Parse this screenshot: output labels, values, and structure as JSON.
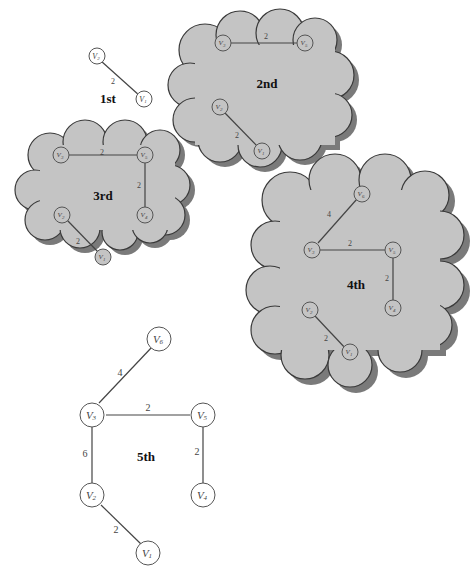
{
  "diagram": {
    "stages": [
      {
        "label": "1st",
        "nodes": [
          {
            "id": "V2",
            "name": "V",
            "sub": "2"
          },
          {
            "id": "V1",
            "name": "V",
            "sub": "1"
          }
        ],
        "edges": [
          {
            "from": "V2",
            "to": "V1",
            "weight": "2"
          }
        ]
      },
      {
        "label": "2nd",
        "nodes": [
          {
            "id": "V3",
            "name": "V",
            "sub": "3"
          },
          {
            "id": "V5",
            "name": "V",
            "sub": "5"
          },
          {
            "id": "V2",
            "name": "V",
            "sub": "2"
          },
          {
            "id": "V1",
            "name": "V",
            "sub": "1"
          }
        ],
        "edges": [
          {
            "from": "V3",
            "to": "V5",
            "weight": "2"
          },
          {
            "from": "V2",
            "to": "V1",
            "weight": "2"
          }
        ]
      },
      {
        "label": "3rd",
        "nodes": [
          {
            "id": "V3",
            "name": "V",
            "sub": "3"
          },
          {
            "id": "V5",
            "name": "V",
            "sub": "5"
          },
          {
            "id": "V2",
            "name": "V",
            "sub": "2"
          },
          {
            "id": "V4",
            "name": "V",
            "sub": "4"
          },
          {
            "id": "V1",
            "name": "V",
            "sub": "1"
          }
        ],
        "edges": [
          {
            "from": "V3",
            "to": "V5",
            "weight": "2"
          },
          {
            "from": "V5",
            "to": "V4",
            "weight": "2"
          },
          {
            "from": "V2",
            "to": "V1",
            "weight": "2"
          }
        ]
      },
      {
        "label": "4th",
        "nodes": [
          {
            "id": "V6",
            "name": "V",
            "sub": "6"
          },
          {
            "id": "V3",
            "name": "V",
            "sub": "3"
          },
          {
            "id": "V5",
            "name": "V",
            "sub": "5"
          },
          {
            "id": "V2",
            "name": "V",
            "sub": "2"
          },
          {
            "id": "V4",
            "name": "V",
            "sub": "4"
          },
          {
            "id": "V1",
            "name": "V",
            "sub": "1"
          }
        ],
        "edges": [
          {
            "from": "V3",
            "to": "V6",
            "weight": "4"
          },
          {
            "from": "V3",
            "to": "V5",
            "weight": "2"
          },
          {
            "from": "V5",
            "to": "V4",
            "weight": "2"
          },
          {
            "from": "V2",
            "to": "V1",
            "weight": "2"
          }
        ]
      },
      {
        "label": "5th",
        "nodes": [
          {
            "id": "V6",
            "name": "V",
            "sub": "6"
          },
          {
            "id": "V3",
            "name": "V",
            "sub": "3"
          },
          {
            "id": "V5",
            "name": "V",
            "sub": "5"
          },
          {
            "id": "V2",
            "name": "V",
            "sub": "2"
          },
          {
            "id": "V4",
            "name": "V",
            "sub": "4"
          },
          {
            "id": "V1",
            "name": "V",
            "sub": "1"
          }
        ],
        "edges": [
          {
            "from": "V3",
            "to": "V6",
            "weight": "4"
          },
          {
            "from": "V3",
            "to": "V5",
            "weight": "2"
          },
          {
            "from": "V3",
            "to": "V2",
            "weight": "6"
          },
          {
            "from": "V5",
            "to": "V4",
            "weight": "2"
          },
          {
            "from": "V2",
            "to": "V1",
            "weight": "2"
          }
        ]
      }
    ]
  },
  "labels": {
    "s1": "1st",
    "s2": "2nd",
    "s3": "3rd",
    "s4": "4th",
    "s5": "5th",
    "w2": "2",
    "w4": "4",
    "w6": "6",
    "v": "V",
    "sub1": "1",
    "sub2": "2",
    "sub3": "3",
    "sub4": "4",
    "sub5": "5",
    "sub6": "6"
  },
  "colors": {
    "cloud_fill": "#c4c4c4",
    "cloud_shadow": "#7a7a7a",
    "edge": "#444444",
    "text": "#111111"
  }
}
